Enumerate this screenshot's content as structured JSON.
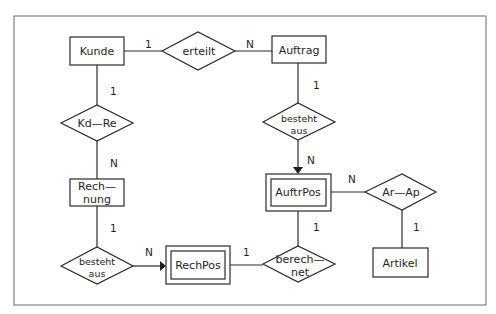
{
  "diagram": {
    "type": "entity-relationship",
    "entities": {
      "kunde": {
        "label": "Kunde"
      },
      "auftrag": {
        "label": "Auftrag"
      },
      "rechnung": {
        "label_line1": "Rech—",
        "label_line2": "nung"
      },
      "rechpos": {
        "label": "RechPos",
        "weak": true
      },
      "auftrpos": {
        "label": "AuftrPos",
        "weak": true
      },
      "artikel": {
        "label": "Artikel"
      }
    },
    "relationships": {
      "erteilt": {
        "label": "erteilt"
      },
      "kd_re": {
        "label": "Kd—Re"
      },
      "besteht_aus_auftrag": {
        "label_line1": "besteht",
        "label_line2": "aus"
      },
      "besteht_aus_rechnung": {
        "label_line1": "besteht",
        "label_line2": "aus"
      },
      "berechnet": {
        "label_line1": "berech—",
        "label_line2": "net"
      },
      "ar_ap": {
        "label": "Ar—Ap"
      }
    },
    "cardinalities": {
      "kunde_erteilt": "1",
      "erteilt_auftrag": "N",
      "kunde_kdre": "1",
      "kdre_rechnung": "N",
      "auftrag_besteht": "1",
      "besteht_auftrpos": "N",
      "rechnung_besteht": "1",
      "besteht_rechpos": "N",
      "rechpos_berechnet": "1",
      "auftrpos_berechnet": "1",
      "auftrpos_arap": "N",
      "arap_artikel": "1"
    }
  }
}
